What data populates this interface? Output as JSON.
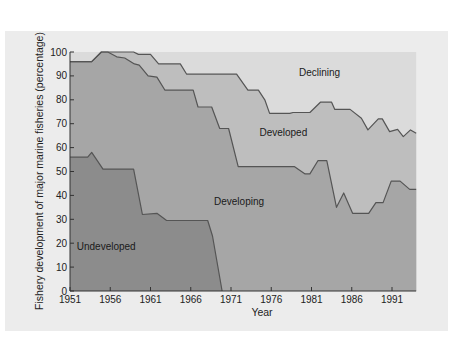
{
  "chart_data": {
    "type": "area",
    "stacked": true,
    "title": "",
    "xlabel": "Year",
    "ylabel": "Fishery development of major marine fisheries (percentage)",
    "xlim": [
      1951,
      1994
    ],
    "ylim": [
      0,
      100
    ],
    "x_ticks": [
      1951,
      1956,
      1961,
      1966,
      1971,
      1976,
      1981,
      1986,
      1991
    ],
    "y_ticks": [
      0,
      10,
      20,
      30,
      40,
      50,
      60,
      70,
      80,
      90,
      100
    ],
    "grid": false,
    "legend": "inline region labels",
    "series": [
      {
        "name": "Undeveloped",
        "color": "#8c8c8c",
        "label_pos": [
          1955.5,
          17
        ],
        "upper_boundary": [
          [
            1951,
            56
          ],
          [
            1953.2,
            56
          ],
          [
            1953.7,
            58
          ],
          [
            1955.1,
            51
          ],
          [
            1958.9,
            51
          ],
          [
            1960,
            32
          ],
          [
            1961.8,
            32.5
          ],
          [
            1963,
            29.5
          ],
          [
            1968.1,
            29.5
          ],
          [
            1968.7,
            23
          ],
          [
            1969.9,
            0
          ]
        ]
      },
      {
        "name": "Developing",
        "color": "#a6a6a6",
        "label_pos": [
          1972,
          36
        ],
        "upper_boundary": [
          [
            1951,
            96
          ],
          [
            1953.7,
            96
          ],
          [
            1954.9,
            100
          ],
          [
            1955.7,
            100
          ],
          [
            1956.8,
            98
          ],
          [
            1957.8,
            97.5
          ],
          [
            1959,
            95
          ],
          [
            1959.6,
            94.5
          ],
          [
            1960.7,
            90
          ],
          [
            1961.8,
            89.5
          ],
          [
            1962.8,
            84
          ],
          [
            1966.3,
            84
          ],
          [
            1966.9,
            77
          ],
          [
            1968.6,
            77
          ],
          [
            1969.6,
            68
          ],
          [
            1970.7,
            68
          ],
          [
            1971.9,
            52
          ],
          [
            1978.9,
            52
          ],
          [
            1980.2,
            49
          ],
          [
            1980.8,
            49
          ],
          [
            1981.8,
            54.5
          ],
          [
            1982.9,
            54.5
          ],
          [
            1984.1,
            35
          ],
          [
            1985,
            41
          ],
          [
            1986.1,
            32.5
          ],
          [
            1988.1,
            32.5
          ],
          [
            1989,
            37
          ],
          [
            1989.9,
            37
          ],
          [
            1990.9,
            46
          ],
          [
            1992,
            46
          ],
          [
            1993.2,
            42.5
          ],
          [
            1994,
            42.5
          ]
        ]
      },
      {
        "name": "Developed",
        "color": "#bebebe",
        "label_pos": [
          1977.5,
          65
        ],
        "upper_boundary": [
          [
            1951,
            96
          ],
          [
            1953.7,
            96
          ],
          [
            1954.9,
            100
          ],
          [
            1955.7,
            100
          ],
          [
            1958.9,
            100
          ],
          [
            1959.5,
            99
          ],
          [
            1961,
            99
          ],
          [
            1962,
            95
          ],
          [
            1964.7,
            95
          ],
          [
            1965.5,
            90.7
          ],
          [
            1971.7,
            90.7
          ],
          [
            1973.1,
            84
          ],
          [
            1974.4,
            84
          ],
          [
            1975.2,
            80
          ],
          [
            1975.8,
            74.3
          ],
          [
            1978.3,
            74.3
          ],
          [
            1978.7,
            74.7
          ],
          [
            1980.8,
            74.7
          ],
          [
            1982.1,
            79
          ],
          [
            1983.5,
            79
          ],
          [
            1983.9,
            76
          ],
          [
            1985.8,
            76
          ],
          [
            1987.2,
            72.3
          ],
          [
            1988,
            67.4
          ],
          [
            1989.3,
            72
          ],
          [
            1989.8,
            72
          ],
          [
            1990.7,
            66.7
          ],
          [
            1991.7,
            67.6
          ],
          [
            1992.4,
            64.6
          ],
          [
            1993.3,
            67.4
          ],
          [
            1994,
            66
          ]
        ]
      },
      {
        "name": "Declining",
        "color": "#dbdbdb",
        "label_pos": [
          1982,
          90
        ],
        "upper_boundary": [
          [
            1951,
            100
          ],
          [
            1994,
            100
          ]
        ]
      }
    ]
  },
  "panel": {
    "background": "#ececec",
    "line_color": "#555555",
    "axis_color": "#333333"
  },
  "text": {
    "xlabel": "Year",
    "ylabel": "Fishery development of major marine fisheries (percentage)"
  }
}
